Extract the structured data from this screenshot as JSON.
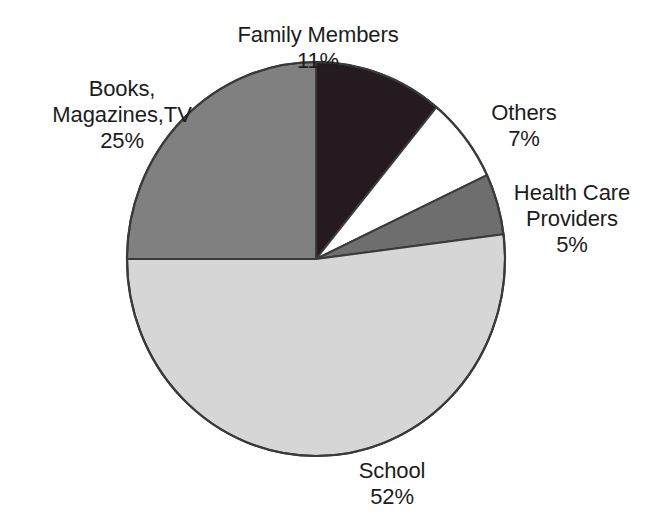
{
  "chart_data": {
    "type": "pie",
    "title": "",
    "subtitle": "",
    "xlabel": "",
    "ylabel": "",
    "legend_position": "none",
    "grid": false,
    "labels_outside": true,
    "start_angle_deg": 0,
    "direction": "clockwise",
    "categories": [
      "Family Members",
      "Others",
      "Health Care Providers",
      "School",
      "Books, Magazines,TV"
    ],
    "values": [
      11,
      7,
      5,
      52,
      25
    ],
    "value_unit": "%",
    "total": 100,
    "slices": [
      {
        "name": "Family Members",
        "label_lines": [
          "Family Members"
        ],
        "value": 11,
        "value_text": "11%",
        "color": "#241a1f",
        "start_deg": 0,
        "end_deg": 39.6
      },
      {
        "name": "Others",
        "label_lines": [
          "Others"
        ],
        "value": 7,
        "value_text": "7%",
        "color": "#ffffff",
        "start_deg": 39.6,
        "end_deg": 64.8
      },
      {
        "name": "Health Care Providers",
        "label_lines": [
          "Health Care",
          "Providers"
        ],
        "value": 5,
        "value_text": "5%",
        "color": "#6e6e6e",
        "start_deg": 64.8,
        "end_deg": 82.8
      },
      {
        "name": "School",
        "label_lines": [
          "School"
        ],
        "value": 52,
        "value_text": "52%",
        "color": "#d6d6d6",
        "start_deg": 82.8,
        "end_deg": 270.0
      },
      {
        "name": "Books, Magazines,TV",
        "label_lines": [
          "Books,",
          "Magazines,TV"
        ],
        "value": 25,
        "value_text": "25%",
        "color": "#808080",
        "start_deg": 270.0,
        "end_deg": 360.0
      }
    ]
  },
  "labels": {
    "family": {
      "line1": "Family Members",
      "value": "11%"
    },
    "others": {
      "line1": "Others",
      "value": "7%"
    },
    "health": {
      "line1": "Health Care",
      "line2": "Providers",
      "value": "5%"
    },
    "books": {
      "line1": "Books,",
      "line2": "Magazines,TV",
      "value": "25%"
    },
    "school": {
      "line1": "School",
      "value": "52%"
    }
  },
  "style": {
    "background": "#ffffff",
    "outline": "#3a3a3a",
    "text": "#1c1c1c"
  }
}
